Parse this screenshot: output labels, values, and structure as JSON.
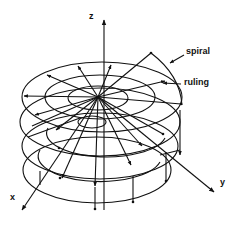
{
  "diagram": {
    "title": "",
    "labels": {
      "z_axis": "z",
      "x_axis": "x",
      "y_axis": "y",
      "spiral": "spiral",
      "ruling": "ruling"
    },
    "colors": {
      "stroke": "#111111",
      "background": "#ffffff"
    }
  }
}
